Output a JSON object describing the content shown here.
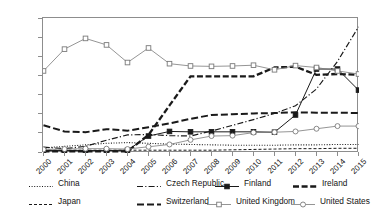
{
  "chart_data": {
    "type": "line",
    "title": "",
    "xlabel": "",
    "ylabel": "Percentage",
    "ylim": [
      0,
      35
    ],
    "yticks": [
      0,
      5,
      10,
      15,
      20,
      25,
      30,
      35
    ],
    "grid": false,
    "legend_position": "bottom",
    "x": [
      "2000",
      "2001",
      "2002",
      "2003",
      "2004",
      "2005",
      "2006",
      "2007",
      "2008",
      "2009",
      "2010",
      "2011",
      "2012",
      "2013",
      "2014",
      "2015"
    ],
    "series": [
      {
        "name": "China",
        "style": "dotted",
        "marker": "none",
        "color": "#1a1a1a",
        "values": [
          1.2,
          1.6,
          2.0,
          2.4,
          2.6,
          2.4,
          2.2,
          2.1,
          2.0,
          1.9,
          1.9,
          1.9,
          2.0,
          2.0,
          2.1,
          2.1
        ]
      },
      {
        "name": "Czech Republic",
        "style": "dash-dot",
        "marker": "none",
        "color": "#1a1a1a",
        "values": [
          1.4,
          1.0,
          1.6,
          3.2,
          4.6,
          4.7,
          4.4,
          4.3,
          5.6,
          7.1,
          8.6,
          10.2,
          12.2,
          16.6,
          23.8,
          32.8
        ]
      },
      {
        "name": "Finland",
        "style": "solid",
        "marker": "filled-square",
        "color": "#1a1a1a",
        "values": [
          0.5,
          0.5,
          0.5,
          0.5,
          0.6,
          4.3,
          5.5,
          5.4,
          5.4,
          5.4,
          5.4,
          5.3,
          9.8,
          21.8,
          21.8,
          16.3
        ]
      },
      {
        "name": "Ireland",
        "style": "dashed-heavy",
        "marker": "none",
        "color": "#1a1a1a",
        "values": [
          0.3,
          0.3,
          0.3,
          0.3,
          0.3,
          4.6,
          12.3,
          19.9,
          19.9,
          19.9,
          19.9,
          22.2,
          22.4,
          20.3,
          20.5,
          20.3
        ]
      },
      {
        "name": "Japan",
        "style": "dashed-thin",
        "marker": "none",
        "color": "#1a1a1a",
        "values": [
          0.6,
          0.6,
          0.6,
          0.6,
          0.6,
          0.6,
          0.6,
          0.6,
          0.6,
          0.7,
          0.8,
          0.9,
          1.0,
          1.0,
          1.1,
          1.1
        ]
      },
      {
        "name": "Switzerland",
        "style": "dashed-medium",
        "marker": "none",
        "color": "#1a1a1a",
        "values": [
          7.1,
          5.5,
          5.3,
          6.1,
          5.7,
          6.6,
          7.6,
          8.8,
          9.8,
          10.0,
          10.2,
          10.3,
          10.5,
          10.4,
          10.4,
          10.3
        ]
      },
      {
        "name": "United Kingdom",
        "style": "solid-thin",
        "marker": "open-square",
        "color": "#7a7a7a",
        "values": [
          21.3,
          27.0,
          29.8,
          28.1,
          23.5,
          27.3,
          23.2,
          22.6,
          22.5,
          22.6,
          22.8,
          21.6,
          22.7,
          22.2,
          21.3,
          20.5
        ]
      },
      {
        "name": "United States",
        "style": "solid-thin",
        "marker": "open-circle",
        "color": "#7a7a7a",
        "values": [
          0.8,
          0.9,
          1.0,
          1.0,
          0.9,
          1.5,
          2.1,
          3.3,
          4.3,
          4.4,
          5.2,
          5.3,
          5.5,
          6.2,
          6.9,
          6.9
        ]
      }
    ]
  },
  "axis": {
    "ylabel": "Percentage",
    "yticks": [
      "0",
      "5",
      "10",
      "15",
      "20",
      "25",
      "30",
      "35"
    ],
    "xticks": [
      "2000",
      "2001",
      "2002",
      "2003",
      "2004",
      "2005",
      "2006",
      "2007",
      "2008",
      "2009",
      "2010",
      "2011",
      "2012",
      "2013",
      "2014",
      "2015"
    ]
  },
  "legend": {
    "entries": [
      {
        "label": "China"
      },
      {
        "label": "Czech Republic"
      },
      {
        "label": "Japan"
      },
      {
        "label": "Switzerland"
      },
      {
        "label": "Finland"
      },
      {
        "label": "Ireland"
      },
      {
        "label": "United Kingdom"
      },
      {
        "label": "United States"
      }
    ]
  }
}
